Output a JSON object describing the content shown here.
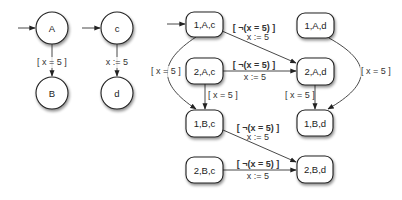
{
  "diagram": {
    "colors": {
      "stroke": "#222222",
      "text": "#333333",
      "fill": "#ffffff",
      "shadow": "#bbbbbb"
    },
    "left": {
      "automaton1": {
        "states": [
          {
            "id": "A",
            "label": "A"
          },
          {
            "id": "B",
            "label": "B"
          }
        ],
        "transitions": [
          {
            "from": "A",
            "to": "B",
            "label": "[ x = 5 ]"
          }
        ]
      },
      "automaton2": {
        "states": [
          {
            "id": "c",
            "label": "c"
          },
          {
            "id": "d",
            "label": "d"
          }
        ],
        "transitions": [
          {
            "from": "c",
            "to": "d",
            "label": "x := 5"
          }
        ]
      }
    },
    "product": {
      "states": [
        {
          "id": "1Ac",
          "label": "1,A,c"
        },
        {
          "id": "1Ad",
          "label": "1,A,d"
        },
        {
          "id": "2Ac",
          "label": "2,A,c"
        },
        {
          "id": "2Ad",
          "label": "2,A,d"
        },
        {
          "id": "1Bc",
          "label": "1,B,c"
        },
        {
          "id": "1Bd",
          "label": "1,B,d"
        },
        {
          "id": "2Bc",
          "label": "2,B,c"
        },
        {
          "id": "2Bd",
          "label": "2,B,d"
        }
      ],
      "transitions": [
        {
          "from": "1,A,c",
          "to": "2,A,d",
          "guard": "[ ¬(x = 5) ]",
          "action": "x := 5"
        },
        {
          "from": "2,A,c",
          "to": "2,A,d",
          "guard": "[ ¬(x = 5) ]",
          "action": "x := 5"
        },
        {
          "from": "1,A,c",
          "to": "1,B,c",
          "guard": "[ x = 5 ]"
        },
        {
          "from": "2,A,c",
          "to": "1,B,c",
          "guard": "[ x = 5 ]"
        },
        {
          "from": "1,A,d",
          "to": "1,B,d",
          "guard": "[ x = 5 ]"
        },
        {
          "from": "2,A,d",
          "to": "1,B,d",
          "guard": "[ x = 5 ]"
        },
        {
          "from": "1,B,c",
          "to": "2,B,d",
          "guard": "[ ¬(x = 5) ]",
          "action": "x := 5"
        },
        {
          "from": "2,B,c",
          "to": "2,B,d",
          "guard": "[ ¬(x = 5) ]",
          "action": "x := 5"
        }
      ]
    }
  }
}
